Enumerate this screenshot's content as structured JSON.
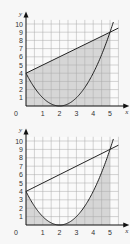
{
  "chart_data": [
    {
      "type": "line",
      "title": "",
      "xlabel": "x",
      "ylabel": "y",
      "xlim": [
        0,
        5.5
      ],
      "ylim": [
        0,
        10.5
      ],
      "grid": true,
      "x_ticks": [
        "0",
        "1",
        "2",
        "3",
        "4",
        "5"
      ],
      "y_ticks": [
        "1",
        "2",
        "3",
        "4",
        "5",
        "6",
        "7",
        "8",
        "9",
        "10"
      ],
      "series": [
        {
          "name": "y = (x-2)^2",
          "function": "(x-2)^2",
          "points": [
            [
              0,
              4
            ],
            [
              1,
              1
            ],
            [
              2,
              0
            ],
            [
              3,
              1
            ],
            [
              4,
              4
            ],
            [
              5,
              9
            ]
          ]
        },
        {
          "name": "y = x + 4",
          "function": "x+4",
          "points": [
            [
              0,
              4
            ],
            [
              5,
              9
            ]
          ]
        }
      ],
      "intersections": [
        [
          0,
          4
        ],
        [
          5,
          9
        ]
      ],
      "shaded_region": "area under y = x + 4 from x=0 to x=5 (between line and x-axis)",
      "colors": {
        "shade": "#d6d6d6",
        "grid": "#a8a8a8",
        "curve": "#222222"
      }
    },
    {
      "type": "line",
      "title": "",
      "xlabel": "x",
      "ylabel": "y",
      "xlim": [
        0,
        5.5
      ],
      "ylim": [
        0,
        10.5
      ],
      "grid": true,
      "x_ticks": [
        "0",
        "1",
        "2",
        "3",
        "4",
        "5"
      ],
      "y_ticks": [
        "1",
        "2",
        "3",
        "4",
        "5",
        "6",
        "7",
        "8",
        "9",
        "10"
      ],
      "series": [
        {
          "name": "y = (x-2)^2",
          "function": "(x-2)^2",
          "points": [
            [
              0,
              4
            ],
            [
              1,
              1
            ],
            [
              2,
              0
            ],
            [
              3,
              1
            ],
            [
              4,
              4
            ],
            [
              5,
              9
            ]
          ]
        },
        {
          "name": "y = x + 4",
          "function": "x+4",
          "points": [
            [
              0,
              4
            ],
            [
              5,
              9
            ]
          ]
        }
      ],
      "intersections": [
        [
          0,
          4
        ],
        [
          5,
          9
        ]
      ],
      "shaded_region": "area under y = (x-2)^2 from x=0 to x=5 (between parabola and x-axis)",
      "colors": {
        "shade": "#d6d6d6",
        "grid": "#a8a8a8",
        "curve": "#222222"
      }
    }
  ],
  "labels": {
    "x_axis": "x",
    "y_axis": "y",
    "origin": "0"
  }
}
